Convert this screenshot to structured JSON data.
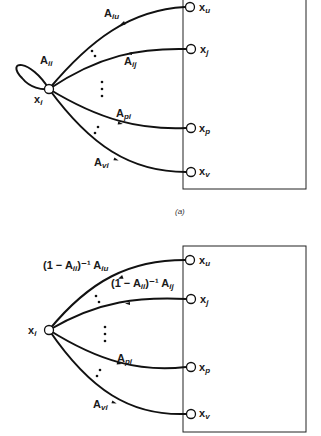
{
  "figure": {
    "panels": [
      {
        "id": "a",
        "caption": "(a)",
        "source_node": {
          "base": "x",
          "sub": "i"
        },
        "self_loop_label": {
          "base": "A",
          "sub": "ii"
        },
        "edges": [
          {
            "label_base": "A",
            "label_sub": "iu",
            "target": "u"
          },
          {
            "label_base": "A",
            "label_sub": "ij",
            "target": "j"
          },
          {
            "label_base": "A",
            "label_sub": "pi",
            "target": "p"
          },
          {
            "label_base": "A",
            "label_sub": "vi",
            "target": "v"
          }
        ],
        "targets": [
          {
            "base": "x",
            "sub": "u"
          },
          {
            "base": "x",
            "sub": "j"
          },
          {
            "base": "x",
            "sub": "p"
          },
          {
            "base": "x",
            "sub": "v"
          }
        ]
      },
      {
        "id": "b",
        "caption": "",
        "source_node": {
          "base": "x",
          "sub": "i"
        },
        "edges": [
          {
            "prefix": "(1 − A",
            "prefix_sub": "ii",
            "mid": ")⁻¹ A",
            "label_sub": "iu",
            "target": "u"
          },
          {
            "prefix": "(1 − A",
            "prefix_sub": "ii",
            "mid": ")⁻¹ A",
            "label_sub": "ij",
            "target": "j"
          },
          {
            "label_base": "A",
            "label_sub": "pi",
            "target": "p"
          },
          {
            "label_base": "A",
            "label_sub": "vi",
            "target": "v"
          }
        ],
        "targets": [
          {
            "base": "x",
            "sub": "u"
          },
          {
            "base": "x",
            "sub": "j"
          },
          {
            "base": "x",
            "sub": "p"
          },
          {
            "base": "x",
            "sub": "v"
          }
        ]
      }
    ],
    "colors": {
      "ink": "#111111",
      "background": "#ffffff"
    }
  }
}
